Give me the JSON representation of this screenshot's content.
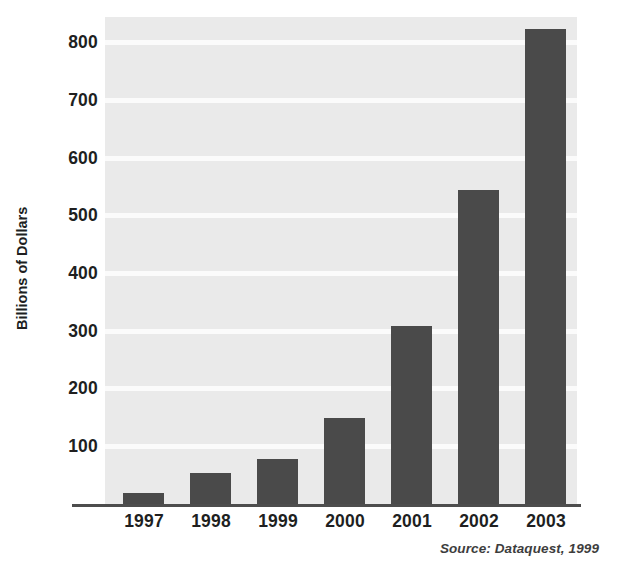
{
  "chart_data": {
    "type": "bar",
    "title": "",
    "subtitle": "",
    "xlabel": "",
    "ylabel": "Billions of Dollars",
    "categories": [
      "1997",
      "1998",
      "1999",
      "2000",
      "2001",
      "2002",
      "2003"
    ],
    "values": [
      20,
      55,
      80,
      150,
      310,
      545,
      825
    ],
    "series": [
      {
        "name": "Billions of Dollars",
        "values": [
          20,
          55,
          80,
          150,
          310,
          545,
          825
        ]
      }
    ],
    "ylim": [
      0,
      845
    ],
    "xlim": [
      0,
      7
    ],
    "yticks": [
      100,
      200,
      300,
      400,
      500,
      600,
      700,
      800
    ],
    "ytick_labels": [
      "100",
      "200",
      "300",
      "400",
      "500",
      "600",
      "700",
      "800"
    ],
    "grid": true,
    "grid_orientation": "horizontal",
    "legend": false,
    "legend_position": "none",
    "annotations": [
      "Source: Dataquest, 1999"
    ],
    "bar_color": "#4a4a4a",
    "plot_background": "#eaeaea",
    "gridline_color": "#fbfbfb",
    "axis_color": "#4d4d4d",
    "text_color": "#201f1f"
  },
  "axes": {
    "y_title": "Billions of Dollars",
    "y_ticks": [
      "800",
      "700",
      "600",
      "500",
      "400",
      "300",
      "200",
      "100"
    ],
    "x_ticks": [
      "1997",
      "1998",
      "1999",
      "2000",
      "2001",
      "2002",
      "2003"
    ]
  },
  "footer": {
    "source": "Source: Dataquest, 1999"
  }
}
